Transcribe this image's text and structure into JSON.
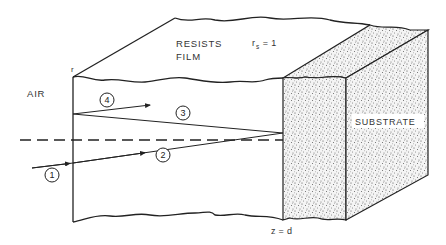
{
  "figure": {
    "regions": {
      "air_label": "AIR",
      "film_label_line1": "RESISTS",
      "film_label_line2": "FILM",
      "substrate_label": "SUBSTRATE"
    },
    "annotations": {
      "r_label": "r",
      "rs_base": "r",
      "rs_sub": "s",
      "rs_value": " = 1",
      "z_label": "z = d"
    },
    "rays": [
      {
        "id": "1",
        "label": "1",
        "description": "incident ray from air"
      },
      {
        "id": "2",
        "label": "2",
        "description": "transmitted ray in film toward substrate"
      },
      {
        "id": "3",
        "label": "3",
        "description": "reflected ray from substrate"
      },
      {
        "id": "4",
        "label": "4",
        "description": "reflected ray at air-film interface"
      }
    ],
    "colors": {
      "line": "#222222",
      "substrate_fill": "#f2f2f2",
      "stipple": "#444444"
    }
  }
}
